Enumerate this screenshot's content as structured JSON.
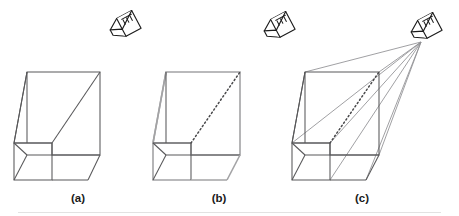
{
  "figure": {
    "background_color": "#ffffff",
    "dark_edge_color": "#58585a",
    "light_edge_color": "#a3a3a5",
    "dotted_edge_color": "#4a4a4c",
    "ray_color": "#8f8f92",
    "icon_color": "#1c1c1c",
    "caption_color": "#1a1a1a"
  },
  "panels": [
    {
      "id": "a",
      "caption": "(a)",
      "caption_x": 78,
      "caption_y": 202,
      "icon": "viewer-eye-icon",
      "has_viewer_icon": false,
      "diagonal_style": "solid",
      "outline_style": "dark",
      "has_rays": false
    },
    {
      "id": "b",
      "caption": "(b)",
      "caption_x": 219,
      "caption_y": 202,
      "icon": "viewer-eye-icon",
      "has_viewer_icon": true,
      "diagonal_style": "dotted",
      "outline_style": "light",
      "has_rays": false
    },
    {
      "id": "c",
      "caption": "(c)",
      "caption_x": 362,
      "caption_y": 202,
      "icon": "viewer-eye-icon",
      "has_viewer_icon": true,
      "diagonal_style": "dotted",
      "outline_style": "dark",
      "has_rays": true
    }
  ],
  "viewer_icons": [
    {
      "name": "viewer-eye-icon-a",
      "x": 124,
      "y": 26,
      "rotation": -28
    },
    {
      "name": "viewer-eye-icon-b",
      "x": 278,
      "y": 27,
      "rotation": -28
    },
    {
      "name": "viewer-eye-icon-c",
      "x": 425,
      "y": 28,
      "rotation": -28
    }
  ],
  "geometry": {
    "shape_a": {
      "top_back_left": [
        27,
        72
      ],
      "top_back_right": [
        100,
        72
      ],
      "bottom_right_far": [
        100,
        155
      ],
      "wedge_apex_left": [
        14,
        143
      ],
      "box_front_top_left": [
        14,
        143
      ],
      "box_front_top_right": [
        52,
        143
      ],
      "box_back_top_right": [
        52,
        155
      ],
      "box_front_bottom_left": [
        14,
        180
      ],
      "box_front_bottom_right": [
        52,
        180
      ],
      "bottom_front_right": [
        88,
        180
      ],
      "diagonal_start": [
        52,
        143
      ],
      "diagonal_end": [
        100,
        72
      ]
    },
    "shape_b": {
      "top_back_left": [
        166,
        72
      ],
      "top_back_right": [
        240,
        72
      ],
      "bottom_right_far": [
        240,
        155
      ],
      "wedge_apex_left": [
        153,
        143
      ],
      "box_front_top_right": [
        191,
        143
      ],
      "box_front_bottom_left": [
        153,
        180
      ],
      "box_front_bottom_right": [
        191,
        180
      ],
      "bottom_front_right": [
        227,
        180
      ],
      "diagonal_start": [
        191,
        143
      ],
      "diagonal_end": [
        240,
        72
      ]
    },
    "shape_c": {
      "top_back_left": [
        305,
        72
      ],
      "top_back_right": [
        379,
        72
      ],
      "bottom_right_far": [
        379,
        155
      ],
      "wedge_apex_left": [
        292,
        143
      ],
      "box_front_top_right": [
        330,
        143
      ],
      "box_front_bottom_left": [
        292,
        180
      ],
      "box_front_bottom_right": [
        330,
        180
      ],
      "bottom_front_right": [
        366,
        180
      ],
      "diagonal_start": [
        330,
        143
      ],
      "diagonal_end": [
        379,
        72
      ]
    },
    "ray_origin": [
      421,
      42
    ],
    "ray_targets": [
      [
        305,
        72
      ],
      [
        379,
        72
      ],
      [
        330,
        143
      ],
      [
        292,
        143
      ],
      [
        330,
        180
      ],
      [
        366,
        180
      ],
      [
        379,
        155
      ]
    ]
  }
}
